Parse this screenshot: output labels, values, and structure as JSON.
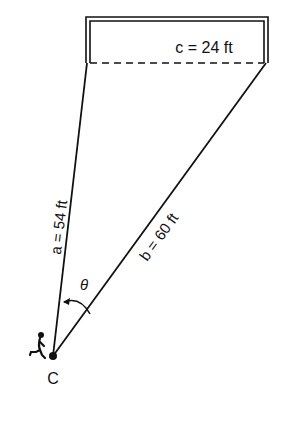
{
  "diagram": {
    "side_c": {
      "label": "c = 24 ft",
      "length_ft": 24
    },
    "side_a": {
      "label": "a = 54 ft",
      "length_ft": 54
    },
    "side_b": {
      "label": "b = 60 ft",
      "length_ft": 60
    },
    "angle": {
      "label": "θ"
    },
    "vertex": {
      "label": "C"
    },
    "colors": {
      "ink": "#111111",
      "background": "#ffffff"
    }
  }
}
